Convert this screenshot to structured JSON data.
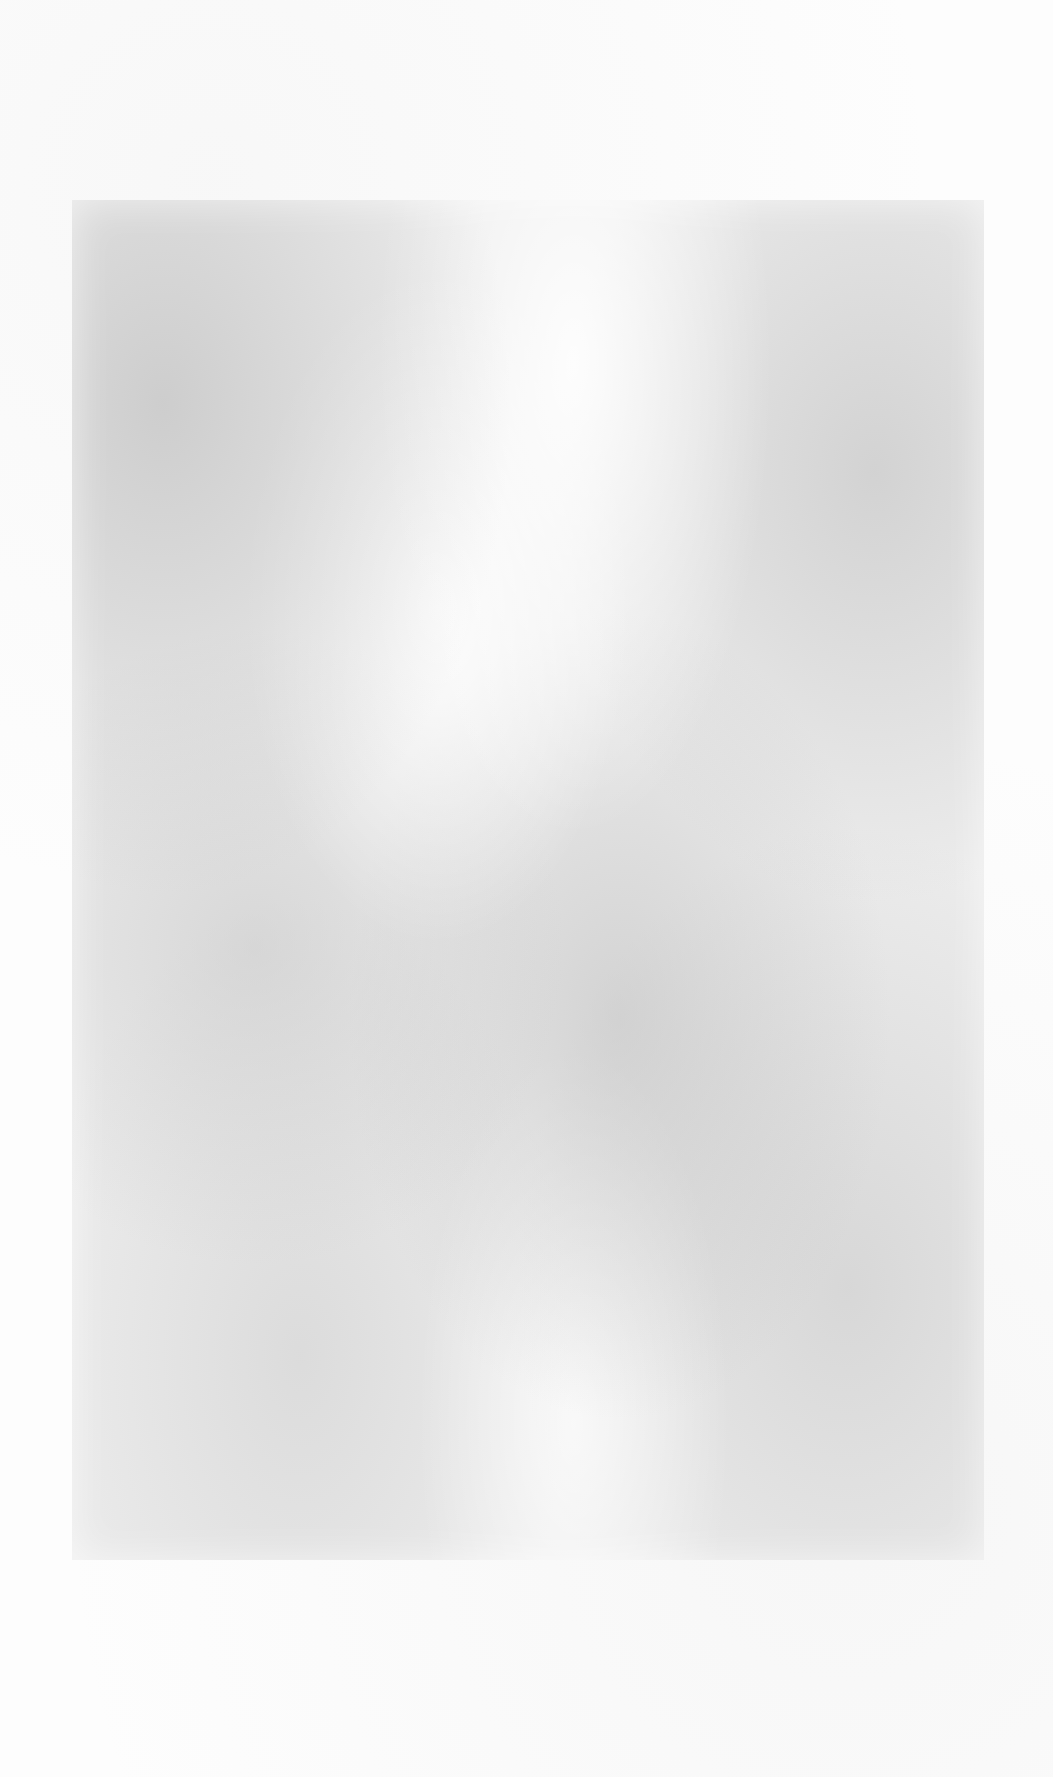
{
  "page": {
    "type": "blank scanned page",
    "background_color": "#fdfdfd",
    "plate_color": "#ececec",
    "text": ""
  }
}
